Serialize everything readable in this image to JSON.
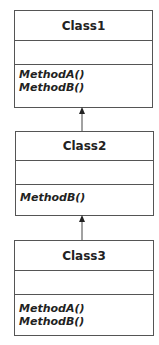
{
  "diagram": {
    "type": "UML class inheritance",
    "classes": [
      {
        "name": "Class1",
        "attributes": [],
        "methods": [
          "MethodA()",
          "MethodB()"
        ]
      },
      {
        "name": "Class2",
        "attributes": [],
        "methods": [
          "MethodB()"
        ]
      },
      {
        "name": "Class3",
        "attributes": [],
        "methods": [
          "MethodA()",
          "MethodB()"
        ]
      }
    ],
    "relations": [
      {
        "from": "Class2",
        "to": "Class1",
        "kind": "inherits"
      },
      {
        "from": "Class3",
        "to": "Class2",
        "kind": "inherits"
      }
    ],
    "colors": {
      "line": "#555555",
      "text": "#222222",
      "background": "#ffffff"
    }
  }
}
